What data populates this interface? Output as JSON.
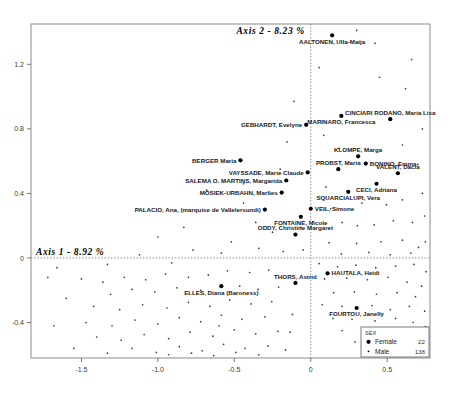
{
  "chart_data": {
    "type": "scatter",
    "title": "",
    "xlabel": "Axis 1 - 8.92 %",
    "ylabel": "Axis 2 - 8.23 %",
    "xlim": [
      -1.83,
      0.78
    ],
    "ylim": [
      -0.62,
      1.45
    ],
    "xticks": [
      "-1.5",
      "-1.0",
      "-0.5",
      "0",
      "0.5"
    ],
    "xtick_values": [
      -1.5,
      -1.0,
      -0.5,
      0,
      0.5
    ],
    "yticks": [
      "1.2",
      "0.8",
      "0.4",
      "0",
      "-0.4"
    ],
    "ytick_values": [
      1.2,
      0.8,
      0.4,
      0,
      -0.4
    ],
    "grid": false,
    "reference_lines": {
      "x": 0,
      "y": 0,
      "style": "dotted"
    },
    "legend": {
      "position": "bottom-right",
      "title": "SEX",
      "entries": [
        {
          "label": "Female",
          "count": "22",
          "marker": "large-dot"
        },
        {
          "label": "Male",
          "count": "138",
          "marker": "small-dot"
        }
      ]
    },
    "series": [
      {
        "name": "Female",
        "marker": "large-dot",
        "labeled_points": [
          {
            "label": "AALTONEN, Ulla-Maija",
            "x": 0.14,
            "y": 1.38,
            "anchor": "below"
          },
          {
            "label": "CINCIARI RODANO, Maria Lisa",
            "x": 0.52,
            "y": 0.86,
            "anchor": "above"
          },
          {
            "label": "MARINARO, Francesca",
            "x": 0.2,
            "y": 0.88,
            "anchor": "below"
          },
          {
            "label": "GEBHARDT, Evelyne",
            "x": -0.03,
            "y": 0.825,
            "anchor": "left"
          },
          {
            "label": "KLOMPE, Marga",
            "x": 0.31,
            "y": 0.63,
            "anchor": "above"
          },
          {
            "label": "BONINO, Emma",
            "x": 0.36,
            "y": 0.585,
            "anchor": "right"
          },
          {
            "label": "BERGER Maria",
            "x": -0.46,
            "y": 0.605,
            "anchor": "left"
          },
          {
            "label": "PROBST, Maria",
            "x": 0.18,
            "y": 0.55,
            "anchor": "above"
          },
          {
            "label": "VALENT, Dacia",
            "x": 0.57,
            "y": 0.525,
            "anchor": "above"
          },
          {
            "label": "VAYSSADE, Marie Claude",
            "x": -0.02,
            "y": 0.53,
            "anchor": "left"
          },
          {
            "label": "SALEMA O. MARTINS, Margarida",
            "x": -0.16,
            "y": 0.48,
            "anchor": "left"
          },
          {
            "label": "CECI, Adriana",
            "x": 0.43,
            "y": 0.46,
            "anchor": "below"
          },
          {
            "label": "MOSIEK-URBAHN, Marlies",
            "x": -0.19,
            "y": 0.405,
            "anchor": "left"
          },
          {
            "label": "SQUARCIALUPI, Vera",
            "x": 0.245,
            "y": 0.41,
            "anchor": "below"
          },
          {
            "label": "PALACIO, Ana, (marquise de Vallelersundi)",
            "x": -0.3,
            "y": 0.3,
            "anchor": "left"
          },
          {
            "label": "VEIL, Simone",
            "x": 0.0,
            "y": 0.305,
            "anchor": "right"
          },
          {
            "label": "FONTAINE, Nicole",
            "x": -0.065,
            "y": 0.255,
            "anchor": "below"
          },
          {
            "label": "ODDY, Christine Margaret",
            "x": -0.1,
            "y": 0.145,
            "anchor": "above"
          },
          {
            "label": "HAUTALA, Heidi",
            "x": 0.11,
            "y": -0.095,
            "anchor": "right"
          },
          {
            "label": "THORS, Astrid",
            "x": -0.1,
            "y": -0.155,
            "anchor": "above"
          },
          {
            "label": "ELLES, Diana (Baroness)",
            "x": -0.585,
            "y": -0.175,
            "anchor": "below"
          },
          {
            "label": "FOURTOU, Janelly",
            "x": 0.3,
            "y": -0.31,
            "anchor": "below"
          }
        ]
      },
      {
        "name": "Male",
        "marker": "small-dot",
        "points": [
          [
            0.055,
            1.18
          ],
          [
            0.3,
            1.41
          ],
          [
            0.42,
            1.33
          ],
          [
            0.66,
            1.23
          ],
          [
            -0.11,
            0.97
          ],
          [
            0.73,
            0.8
          ],
          [
            0.62,
            1.05
          ],
          [
            0.45,
            1.12
          ],
          [
            -0.155,
            0.72
          ],
          [
            0.085,
            0.76
          ],
          [
            -0.2,
            0.55
          ],
          [
            0.1,
            0.44
          ],
          [
            0.185,
            0.68
          ],
          [
            0.6,
            0.7
          ],
          [
            0.7,
            0.58
          ],
          [
            0.335,
            0.34
          ],
          [
            0.13,
            0.305
          ],
          [
            0.495,
            0.33
          ],
          [
            0.6,
            0.36
          ],
          [
            0.73,
            0.4
          ],
          [
            -0.68,
            0.42
          ],
          [
            -0.44,
            0.34
          ],
          [
            -0.36,
            0.22
          ],
          [
            -0.25,
            0.16
          ],
          [
            -0.065,
            0.19
          ],
          [
            0.015,
            0.225
          ],
          [
            0.205,
            0.22
          ],
          [
            0.305,
            0.2
          ],
          [
            0.415,
            0.205
          ],
          [
            0.54,
            0.23
          ],
          [
            0.665,
            0.22
          ],
          [
            0.745,
            0.26
          ],
          [
            0.12,
            0.095
          ],
          [
            0.3,
            0.09
          ],
          [
            0.46,
            0.1
          ],
          [
            0.6,
            0.11
          ],
          [
            0.705,
            0.065
          ],
          [
            0.2,
            0.025
          ],
          [
            0.38,
            0.035
          ],
          [
            0.52,
            0.02
          ],
          [
            0.655,
            0.03
          ],
          [
            0.75,
            0.1
          ],
          [
            -0.83,
            0.19
          ],
          [
            -1.0,
            0.13
          ],
          [
            -0.52,
            0.1
          ],
          [
            -0.34,
            0.06
          ],
          [
            -0.18,
            0.04
          ],
          [
            -0.05,
            0.05
          ],
          [
            0.055,
            -0.035
          ],
          [
            0.175,
            -0.055
          ],
          [
            0.295,
            -0.045
          ],
          [
            0.425,
            -0.06
          ],
          [
            0.555,
            -0.05
          ],
          [
            0.675,
            -0.04
          ],
          [
            0.755,
            -0.085
          ],
          [
            0.09,
            -0.13
          ],
          [
            0.235,
            -0.125
          ],
          [
            0.37,
            -0.135
          ],
          [
            0.505,
            -0.12
          ],
          [
            0.63,
            -0.15
          ],
          [
            0.725,
            -0.175
          ],
          [
            0.15,
            -0.215
          ],
          [
            0.285,
            -0.21
          ],
          [
            0.43,
            -0.225
          ],
          [
            0.565,
            -0.215
          ],
          [
            0.685,
            -0.24
          ],
          [
            0.075,
            -0.29
          ],
          [
            0.205,
            -0.3
          ],
          [
            0.4,
            -0.295
          ],
          [
            0.52,
            -0.32
          ],
          [
            0.645,
            -0.3
          ],
          [
            0.745,
            -0.33
          ],
          [
            0.145,
            -0.375
          ],
          [
            0.27,
            -0.38
          ],
          [
            0.42,
            -0.39
          ],
          [
            0.555,
            -0.375
          ],
          [
            0.67,
            -0.4
          ],
          [
            0.75,
            -0.425
          ],
          [
            0.205,
            -0.45
          ],
          [
            0.345,
            -0.46
          ],
          [
            0.49,
            -0.455
          ],
          [
            0.615,
            -0.48
          ],
          [
            0.72,
            -0.5
          ],
          [
            0.29,
            -0.52
          ],
          [
            0.44,
            -0.53
          ],
          [
            0.585,
            -0.55
          ],
          [
            0.69,
            -0.565
          ],
          [
            0.37,
            -0.585
          ],
          [
            0.505,
            -0.59
          ],
          [
            0.64,
            -0.58
          ],
          [
            -0.275,
            -0.075
          ],
          [
            -0.4,
            -0.09
          ],
          [
            -0.545,
            -0.08
          ],
          [
            -0.67,
            -0.105
          ],
          [
            -0.8,
            -0.12
          ],
          [
            -0.95,
            -0.1
          ],
          [
            -1.08,
            -0.135
          ],
          [
            -1.22,
            -0.12
          ],
          [
            -1.36,
            -0.15
          ],
          [
            -1.5,
            -0.13
          ],
          [
            -0.21,
            -0.18
          ],
          [
            -0.345,
            -0.195
          ],
          [
            -0.465,
            -0.175
          ],
          [
            -0.72,
            -0.2
          ],
          [
            -0.875,
            -0.185
          ],
          [
            -1.02,
            -0.21
          ],
          [
            -1.17,
            -0.195
          ],
          [
            -1.31,
            -0.225
          ],
          [
            -0.255,
            -0.27
          ],
          [
            -0.39,
            -0.285
          ],
          [
            -0.53,
            -0.26
          ],
          [
            -0.66,
            -0.3
          ],
          [
            -0.8,
            -0.275
          ],
          [
            -0.94,
            -0.31
          ],
          [
            -1.1,
            -0.29
          ],
          [
            -1.25,
            -0.32
          ],
          [
            -1.42,
            -0.3
          ],
          [
            -0.3,
            -0.365
          ],
          [
            -0.45,
            -0.38
          ],
          [
            -0.585,
            -0.355
          ],
          [
            -0.72,
            -0.395
          ],
          [
            -0.86,
            -0.37
          ],
          [
            -1.0,
            -0.41
          ],
          [
            -1.15,
            -0.385
          ],
          [
            -1.3,
            -0.42
          ],
          [
            -1.47,
            -0.4
          ],
          [
            -0.215,
            -0.455
          ],
          [
            -0.36,
            -0.47
          ],
          [
            -0.5,
            -0.445
          ],
          [
            -0.64,
            -0.485
          ],
          [
            -0.79,
            -0.46
          ],
          [
            -0.93,
            -0.5
          ],
          [
            -1.09,
            -0.475
          ],
          [
            -1.24,
            -0.51
          ],
          [
            -1.4,
            -0.49
          ],
          [
            -0.28,
            -0.545
          ],
          [
            -0.43,
            -0.56
          ],
          [
            -0.57,
            -0.535
          ],
          [
            -0.71,
            -0.575
          ],
          [
            -0.86,
            -0.55
          ],
          [
            -1.01,
            -0.585
          ],
          [
            -1.17,
            -0.56
          ],
          [
            -1.33,
            -0.59
          ],
          [
            -0.34,
            -0.6
          ],
          [
            -0.49,
            -0.585
          ],
          [
            -0.635,
            -0.605
          ],
          [
            -0.78,
            -0.59
          ],
          [
            -0.93,
            -0.6
          ],
          [
            -0.12,
            -0.35
          ],
          [
            -0.135,
            -0.46
          ],
          [
            -0.165,
            -0.57
          ],
          [
            -1.6,
            -0.25
          ],
          [
            -1.68,
            -0.42
          ],
          [
            -1.55,
            -0.56
          ],
          [
            -1.72,
            -0.12
          ],
          [
            -0.585,
            0.03
          ],
          [
            -0.6,
            -0.42
          ],
          [
            -0.44,
            0.46
          ],
          [
            -0.77,
            0.05
          ],
          [
            -0.91,
            -0.03
          ],
          [
            -1.12,
            0.02
          ],
          [
            -1.33,
            -0.04
          ],
          [
            -1.53,
            0.02
          ],
          [
            -1.66,
            -0.06
          ]
        ]
      }
    ]
  }
}
